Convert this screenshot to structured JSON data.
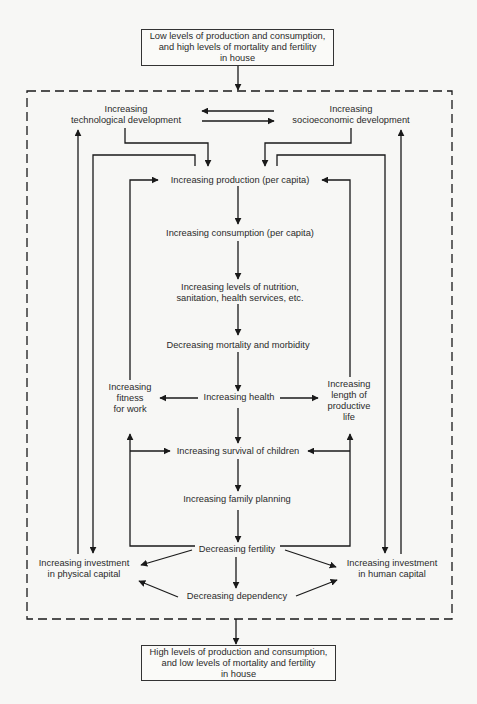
{
  "diagram": {
    "start_box": {
      "lines": [
        "Low levels of production and consumption,",
        "and high levels of mortality and fertility",
        "in house"
      ]
    },
    "end_box": {
      "lines": [
        "High levels of production and consumption,",
        "and low levels of mortality and fertility",
        "in house"
      ]
    },
    "nodes": {
      "tech_dev": [
        "Increasing",
        "technological development"
      ],
      "socio_dev": [
        "Increasing",
        "socioeconomic development"
      ],
      "production": "Increasing production (per capita)",
      "consumption": "Increasing consumption (per capita)",
      "nutrition": [
        "Increasing levels of nutrition,",
        "sanitation, health services, etc."
      ],
      "mortality": "Decreasing mortality and morbidity",
      "fitness": [
        "Increasing",
        "fitness",
        "for work"
      ],
      "health": "Increasing health",
      "productive_life": [
        "Increasing",
        "length of",
        "productive",
        "life"
      ],
      "survival": "Increasing survival of children",
      "family_planning": "Increasing family planning",
      "fertility": "Decreasing fertility",
      "invest_physical": [
        "Increasing investment",
        "in physical capital"
      ],
      "invest_human": [
        "Increasing investment",
        "in human capital"
      ],
      "dependency": "Decreasing dependency"
    },
    "edges": [
      [
        "start_box",
        "dashed_region"
      ],
      [
        "tech_dev",
        "socio_dev"
      ],
      [
        "socio_dev",
        "tech_dev"
      ],
      [
        "tech_dev",
        "production"
      ],
      [
        "socio_dev",
        "production"
      ],
      [
        "production",
        "consumption"
      ],
      [
        "consumption",
        "nutrition"
      ],
      [
        "nutrition",
        "mortality"
      ],
      [
        "mortality",
        "health"
      ],
      [
        "health",
        "fitness"
      ],
      [
        "health",
        "productive_life"
      ],
      [
        "health",
        "survival"
      ],
      [
        "fitness",
        "production"
      ],
      [
        "productive_life",
        "production"
      ],
      [
        "survival",
        "family_planning"
      ],
      [
        "family_planning",
        "fertility"
      ],
      [
        "fertility",
        "survival"
      ],
      [
        "fertility",
        "fitness"
      ],
      [
        "fertility",
        "productive_life"
      ],
      [
        "fertility",
        "invest_physical"
      ],
      [
        "fertility",
        "invest_human"
      ],
      [
        "fertility",
        "dependency"
      ],
      [
        "dependency",
        "invest_physical"
      ],
      [
        "dependency",
        "invest_human"
      ],
      [
        "production",
        "invest_physical"
      ],
      [
        "production",
        "invest_human"
      ],
      [
        "invest_physical",
        "tech_dev"
      ],
      [
        "invest_human",
        "socio_dev"
      ],
      [
        "dashed_region",
        "end_box"
      ]
    ],
    "colors": {
      "line": "#1a1a1a",
      "background": "#f7f7f5"
    }
  }
}
